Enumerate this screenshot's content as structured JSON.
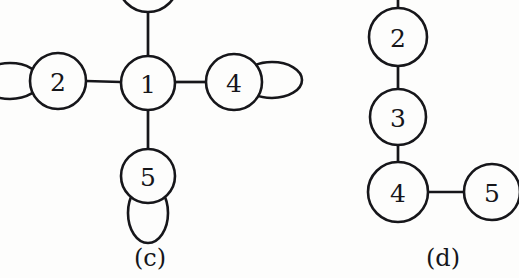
{
  "figure": {
    "background_color": "#fdfdfc",
    "ink_color": "#16161a",
    "panels": [
      {
        "caption": "(c)",
        "caption_x": 150,
        "caption_y": 258,
        "description": "star graph centered on node 1 with self-loops",
        "nodes": [
          {
            "label": "",
            "cx": 148,
            "cy": -18,
            "r": 30,
            "clipped_top": true
          },
          {
            "label": "1",
            "cx": 148,
            "cy": 83,
            "r": 27,
            "clipped_top": false
          },
          {
            "label": "2",
            "cx": 58,
            "cy": 81,
            "r": 28,
            "clipped_top": false
          },
          {
            "label": "4",
            "cx": 234,
            "cy": 82,
            "r": 28,
            "clipped_top": false
          },
          {
            "label": "5",
            "cx": 148,
            "cy": 176,
            "r": 27,
            "clipped_top": false
          }
        ],
        "edges": [
          {
            "x1": 148,
            "y1": 12,
            "x2": 148,
            "y2": 56,
            "from": "top-node",
            "to": "1"
          },
          {
            "x1": 86,
            "y1": 81,
            "x2": 121,
            "y2": 82,
            "from": "2",
            "to": "1"
          },
          {
            "x1": 175,
            "y1": 82,
            "x2": 206,
            "y2": 82,
            "from": "1",
            "to": "4"
          },
          {
            "x1": 148,
            "y1": 110,
            "x2": 148,
            "y2": 149,
            "from": "1",
            "to": "5"
          }
        ],
        "self_loops": [
          {
            "node": "2",
            "cx": 10,
            "cy": 81,
            "rx": 30,
            "ry": 18,
            "rotation": 0,
            "clipped_left": true
          },
          {
            "node": "4",
            "cx": 272,
            "cy": 80,
            "rx": 30,
            "ry": 18,
            "rotation": 0,
            "clipped_left": false
          },
          {
            "node": "5",
            "cx": 148,
            "cy": 213,
            "rx": 20,
            "ry": 30,
            "rotation": 0,
            "clipped_left": false
          }
        ]
      },
      {
        "caption": "(d)",
        "caption_x": 443,
        "caption_y": 258,
        "description": "path graph 2-3-4-5 with node 4 branching right to node 5",
        "nodes": [
          {
            "label": "2",
            "cx": 398,
            "cy": 37,
            "r": 29,
            "clipped_top": false
          },
          {
            "label": "3",
            "cx": 398,
            "cy": 117,
            "r": 28,
            "clipped_top": false
          },
          {
            "label": "4",
            "cx": 398,
            "cy": 192,
            "r": 30,
            "clipped_top": false
          },
          {
            "label": "5",
            "cx": 492,
            "cy": 192,
            "r": 28,
            "clipped_top": false
          }
        ],
        "edges": [
          {
            "x1": 398,
            "y1": -4,
            "x2": 398,
            "y2": 9,
            "from": "above",
            "to": "2"
          },
          {
            "x1": 398,
            "y1": 66,
            "x2": 398,
            "y2": 89,
            "from": "2",
            "to": "3"
          },
          {
            "x1": 398,
            "y1": 145,
            "x2": 398,
            "y2": 162,
            "from": "3",
            "to": "4"
          },
          {
            "x1": 428,
            "y1": 192,
            "x2": 464,
            "y2": 192,
            "from": "4",
            "to": "5"
          }
        ],
        "self_loops": []
      }
    ]
  },
  "graph_data": {
    "panel_c": {
      "vertices": [
        "1",
        "2",
        "4",
        "5"
      ],
      "edges": [
        [
          "1",
          "2"
        ],
        [
          "1",
          "4"
        ],
        [
          "1",
          "5"
        ]
      ],
      "loops": [
        "2",
        "4",
        "5"
      ]
    },
    "panel_d": {
      "vertices": [
        "2",
        "3",
        "4",
        "5"
      ],
      "edges": [
        [
          "2",
          "3"
        ],
        [
          "3",
          "4"
        ],
        [
          "4",
          "5"
        ]
      ],
      "loops": []
    }
  }
}
